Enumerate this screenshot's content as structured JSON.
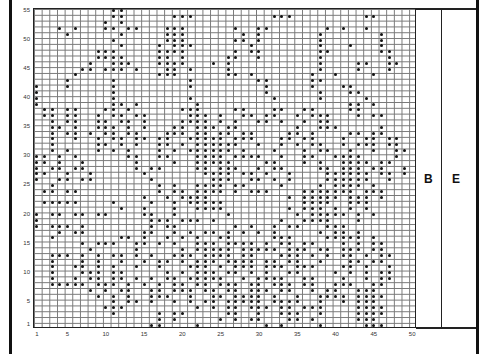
{
  "chart": {
    "columns": 50,
    "rows": 55,
    "x_ticks": [
      {
        "label": "1",
        "col": 1
      },
      {
        "label": "5",
        "col": 5
      },
      {
        "label": "10",
        "col": 10
      },
      {
        "label": "15",
        "col": 15
      },
      {
        "label": "20",
        "col": 20
      },
      {
        "label": "25",
        "col": 25
      },
      {
        "label": "30",
        "col": 30
      },
      {
        "label": "35",
        "col": 35
      },
      {
        "label": "40",
        "col": 40
      },
      {
        "label": "45",
        "col": 45
      },
      {
        "label": "50",
        "col": 50
      }
    ],
    "y_ticks": [
      {
        "label": "1",
        "row": 1
      },
      {
        "label": "5",
        "row": 5
      },
      {
        "label": "10",
        "row": 10
      },
      {
        "label": "15",
        "row": 15
      },
      {
        "label": "20",
        "row": 20
      },
      {
        "label": "25",
        "row": 25
      },
      {
        "label": "30",
        "row": 30
      },
      {
        "label": "35",
        "row": 35
      },
      {
        "label": "40",
        "row": 40
      },
      {
        "label": "45",
        "row": 45
      },
      {
        "label": "50",
        "row": 50
      },
      {
        "label": "55",
        "row": 55
      }
    ],
    "side_columns": [
      {
        "label": "B"
      },
      {
        "label": "E"
      }
    ],
    "dot_color": "#111111",
    "grid_color": "#777777",
    "pattern_rows_top_to_bottom": [
      "..........##........................................",
      "..........##......###..........###.........##....",
      ".........#.#.....................................",
      "...#.#...##.##...###......#..##.......#.#..#.....",
      "....#......#.....###.......#.#.......#.......#...",
      "..........#......###......##.#.......#.......#...",
      "...........#....#.###.......#........#...#...#...",
      "........###.....####......#.##.......##......##..",
      "........####....##.#.....##..#.......#........#..",
      ".......#..###...####...#.#...........#....##..##.",
      "......##.###.#...##.#....#...........#....#...#..",
      ".....#..........###......##.#.......#..#....#....",
      "....#.....#.........#........##.....##...........",
      "#...#.....#.........#.........#.....#...##.......",
      "#.........#...................#......#...##.......",
      "#.........#.........#..........#.....#.....#......",
      "#.........##.#.......#...................##.#....",
      ".##.##...##.#......###....##...##..##....##......",
      ".##.##..#.##.##.....###.#..##.##..#.###...#.##...",
      "..#.##..##.##.#....####.#.#..##.#..#.##.........",
      "..##.#..###.#.#...##.###.##.......#..###.....#...",
      "..#.##.#.##.##...###.##.##.##....##.#....##.##...",
      "..#..#..#.##.##.##..#####.###...##.##...#..##.##.",
      "..#.....##.#.#..##.#.######..#..#.#.##..#.###.##.",
      "..#.#...#.#.#...#.#.######.#...#...#.##..#..#..##",
      "##.#.#......##..##...####.####..#..##..####....#.",
      "##.#..#......#....#..#####....##...#.#..####.##..",
      "#.##.##......#.##....##.###..#.##....##.###.##..#",
      "##..#..#......#.......####.##.#..#....######.##.#",
      "#..##.##.......#.......###..##.#.#....######..#..",
      "..#.............#.#..####.##....#....#.####.#....",
      ".##.##..........#.##.####.#.###....#######.###...",
      "..............#..#.####..........#.#####.###.#...",
      ".#####....#....#..#.#####..........####..###.....",
      "...........#..#...#..####........#.###.#.#.#.....",
      "#.##.##.##....##..#......#........#.#####.#.#....",
      "#..............###.###.#........#..####...#......",
      "#.###.#........#.##.......#.#..#.##...###........",
      "...#.##.......##..#.#.##.#.#.#.#.....#.##.#......",
      "..#........##.#..#.#.#..##.....###....#####.#....",
      "......#.###..##.#.#..###.####.#.##.##...#.#.##...",
      ".......#.....#.....#.#####.#####.###.##.###.##...",
      "..###.#.#.##.#.#..###.####.##...###.#.#.##.#.##..",
      "..#...#.#..#..#.##.#.###.####.##.##..#...##.##...",
      "..#..##.#.#..#..#...###.#.###.###.###...##.#..#..",
      "..#...###.##.....#.#.###.##.#.#..##....#.#.#.##..",
      "..#..#.##.##.#.#.##.#####..#.####..##...#..#.##..",
      "..#####.###.#.#.#.##.##.###.##.###.##..###..##...",
      ".......#.#.##..##.###.##.##.###.##..#.##..###....",
      "........#.#.#..###..#..##.####.#..#..####.####...",
      "..........#.##.#..#.#.##.#####.####..#..#.###....",
      ".........###.........#.#.##.###.##.###....####...",
      "..........#.....#.##.....##..#..###..#....####...",
      "................#.#.....#.#.##...##.#.....###....",
      "...............##....#........#.#....#.....###..."
    ]
  }
}
